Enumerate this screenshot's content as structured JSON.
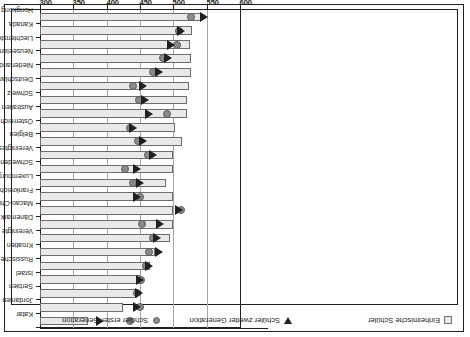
{
  "legend": {
    "position": "bottom",
    "rotated_180": true,
    "items": [
      {
        "key": "native",
        "label": "Einheimische Schüler",
        "symbol": "square"
      },
      {
        "key": "second",
        "label": "Schüler zweiter Generation",
        "symbol": "triangle-down"
      },
      {
        "key": "first",
        "label": "Schüler erster Generation",
        "symbol": "circle"
      }
    ]
  },
  "axis": {
    "ticks": [
      "300",
      "350",
      "400",
      "450",
      "500",
      "550",
      "600"
    ],
    "min": 300,
    "max": 600,
    "step": 50,
    "orientation": "rotated-90"
  },
  "colors": {
    "bar_fill": "#e9e9e9",
    "bar_stroke": "#6d6d6d",
    "marker_circle": "#8a8a8a",
    "marker_triangle": "#231f20",
    "grid": "#a6a6a6",
    "axis": "#231f20"
  },
  "chart_data": {
    "type": "bar",
    "title": "",
    "xlabel": "",
    "ylabel": "",
    "ylim": [
      300,
      600
    ],
    "grid": true,
    "legend_position": "bottom",
    "categories": [
      "Katar",
      "Jordanien",
      "Serbien",
      "Israel",
      "Russische Föderation",
      "Kroatien",
      "Vereinigte Staaten",
      "Dänemark",
      "Macao-China",
      "Frankreich",
      "Luxemburg",
      "Schweden",
      "Vereinigtes Königreich",
      "Belgien",
      "Österreich",
      "Australien",
      "Schweiz",
      "Deutschland",
      "Niederlande",
      "Neuseeland",
      "Liechtenstein",
      "Kanada",
      "Hongkong"
    ],
    "series": [
      {
        "name": "Einheimische Schüler",
        "symbol": "bar",
        "values": [
          372,
          425,
          446,
          450,
          465,
          473,
          495,
          500,
          500,
          500,
          489,
          500,
          500,
          513,
          502,
          520,
          521,
          523,
          526,
          527,
          525,
          528,
          543
        ]
      },
      {
        "name": "Schüler zweiter Generation",
        "symbol": "triangle-down",
        "values": [
          390,
          446,
          448,
          450,
          463,
          478,
          476,
          480,
          508,
          446,
          450,
          445,
          470,
          455,
          440,
          463,
          457,
          455,
          478,
          492,
          497,
          511,
          546
        ]
      },
      {
        "name": "Schüler erster Generation",
        "symbol": "circle",
        "values": [
          435,
          450,
          446,
          452,
          459,
          464,
          470,
          453,
          511,
          450,
          440,
          427,
          462,
          447,
          435,
          490,
          449,
          440,
          470,
          484,
          505,
          508,
          527
        ]
      }
    ]
  }
}
